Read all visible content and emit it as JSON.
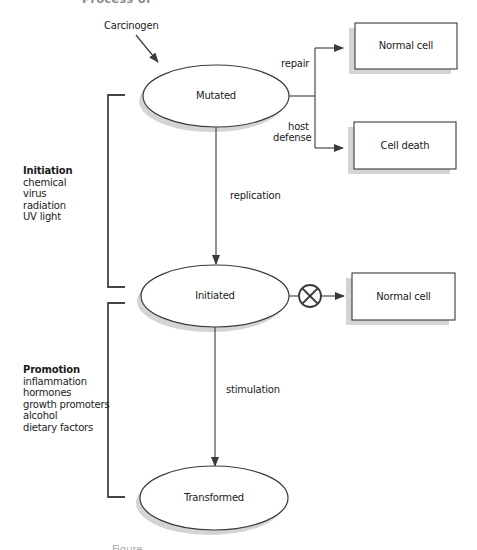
{
  "figure": {
    "title_partial": "Process of carcinogenesis",
    "caption_partial": "Figure"
  },
  "inputs": {
    "carcinogen": "Carcinogen"
  },
  "nodes": {
    "mutated": "Mutated",
    "initiated": "Initiated",
    "transformed": "Transformed"
  },
  "outcomes": [
    {
      "label": "Normal cell",
      "via": "repair"
    },
    {
      "label": "Cell death",
      "via": "host defense"
    },
    {
      "label": "Normal cell",
      "via": "blocked"
    }
  ],
  "edges": {
    "repair": "repair",
    "host_defense_line1": "host",
    "host_defense_line2": "defense",
    "replication": "replication",
    "stimulation": "stimulation"
  },
  "stages": [
    {
      "heading": "Initiation",
      "factors": [
        "chemical",
        "virus",
        "radiation",
        "UV light"
      ]
    },
    {
      "heading": "Promotion",
      "factors": [
        "inflammation",
        "hormones",
        "growth promoters",
        "alcohol",
        "dietary factors"
      ]
    }
  ],
  "colors": {
    "stroke": "#3a3a3a",
    "shadow": "#d4d4d4",
    "background": "#ffffff"
  }
}
